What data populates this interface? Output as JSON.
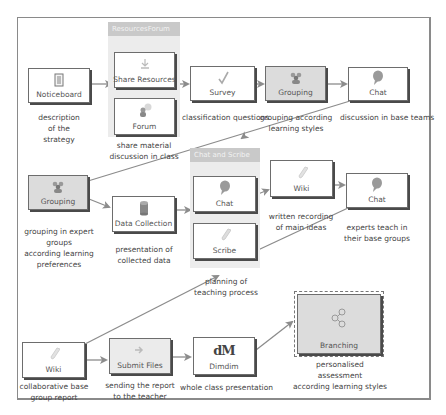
{
  "diagram": {
    "groups": [
      {
        "id": "resources-forum",
        "label": "ResourcesForum",
        "description": "share material\ndiscussion in class"
      },
      {
        "id": "chat-and-scribe",
        "label": "Chat and Scribe",
        "description": "planning of\nteaching process"
      }
    ],
    "nodes": {
      "noticeboard": {
        "label": "Noticeboard",
        "icon": "noticeboard-icon",
        "description": "description\nof the\nstrategy"
      },
      "share_resources": {
        "label": "Share Resources",
        "icon": "share-resources-icon"
      },
      "forum": {
        "label": "Forum",
        "icon": "forum-icon"
      },
      "survey": {
        "label": "Survey",
        "icon": "survey-check-icon",
        "description": "classification questions"
      },
      "grouping_1": {
        "label": "Grouping",
        "icon": "grouping-icon",
        "description": "grouping according\nlearning styles"
      },
      "chat_1": {
        "label": "Chat",
        "icon": "chat-bubble-icon",
        "description": "discussion in base teams"
      },
      "grouping_2": {
        "label": "Grouping",
        "icon": "grouping-icon",
        "description": "grouping in expert groups\naccording learning\npreferences"
      },
      "data_collection": {
        "label": "Data Collection",
        "icon": "database-icon",
        "description": "presentation of\ncollected data"
      },
      "chat_2": {
        "label": "Chat",
        "icon": "chat-bubble-icon"
      },
      "scribe": {
        "label": "Scribe",
        "icon": "scribe-icon"
      },
      "wiki_1": {
        "label": "Wiki",
        "icon": "wiki-icon",
        "description": "written recording\nof main ideas"
      },
      "chat_3": {
        "label": "Chat",
        "icon": "chat-bubble-icon",
        "description": "experts teach in\ntheir base groups"
      },
      "wiki_2": {
        "label": "Wiki",
        "icon": "wiki-icon",
        "description": "collaborative base\ngroup report"
      },
      "submit_files": {
        "label": "Submit Files",
        "icon": "submit-arrow-icon",
        "description": "sending the report\nto the teacher"
      },
      "dimdim": {
        "label": "Dimdim",
        "icon": "dimdim-logo-icon",
        "description": "whole class presentation"
      },
      "branching": {
        "label": "Branching",
        "icon": "branching-icon",
        "description": "personalised\nassessment\naccording learning styles"
      }
    },
    "colors": {
      "frame": "#8a8a8a",
      "node_border": "#6d6d6d",
      "node_shadow": "#4a4a4a",
      "gray_node": "#dcdcdc",
      "group_bg": "#ececec",
      "group_label_bg": "#c9c9c9",
      "arrow": "#8c8c8c"
    }
  }
}
